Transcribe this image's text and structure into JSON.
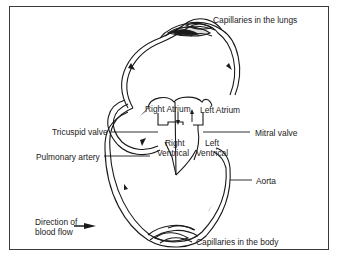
{
  "labels": {
    "capillaries_lungs": "Capillaries in the lungs",
    "right_atrium": "Right Atrium",
    "left_atrium": "Left Atrium",
    "tricuspid_valve": "Tricuspid valve",
    "mitral_valve": "Mitral valve",
    "right_ventrical_1": "Right",
    "right_ventrical_2": "Ventrical",
    "left_ventrical_1": "Left",
    "left_ventrical_2": "Ventrical",
    "pulmonary_artery": "Pulmonary artery",
    "aorta": "Aorta",
    "direction_1": "Direction of",
    "direction_2": "blood flow",
    "capillaries_body": "Capillaries in the body"
  },
  "colors": {
    "ink": "#1a1a1a",
    "frame": "#3a3a3a",
    "background": "#ffffff"
  }
}
